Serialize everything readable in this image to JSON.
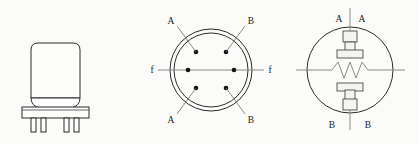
{
  "figure": {
    "background_color": "#fbfbf9",
    "line_color": "#2b2b2b",
    "label_color": "#1a1a1a"
  },
  "panels": {
    "tube_outline": {
      "name": "tube-outline-view",
      "description": "Perspective outline of the glass envelope tube mounted on a rectangular base with four connecting pins",
      "pin_count": 4
    },
    "base_pinout": {
      "name": "base-pinout-view",
      "description": "Bottom view of the tube base showing six contact pins inside two concentric circles",
      "pin_count": 6,
      "pin_labels": {
        "top_left": "A",
        "top_right": "B",
        "left": "f",
        "right": "f",
        "bottom_left": "A",
        "bottom_right": "B"
      },
      "leader_labels": [
        {
          "id": "a-top",
          "text": "A"
        },
        {
          "id": "b-top",
          "text": "B"
        },
        {
          "id": "f-left",
          "text": "f"
        },
        {
          "id": "f-right",
          "text": "f"
        },
        {
          "id": "a-bottom",
          "text": "A"
        },
        {
          "id": "b-bottom",
          "text": "B"
        }
      ]
    },
    "schematic": {
      "name": "internal-schematic-view",
      "description": "Circular envelope schematic with upper electrode A-A, lower electrode B-B and a zigzag resistive filament element across the centre",
      "top_terminals": [
        {
          "id": "a-left",
          "text": "A"
        },
        {
          "id": "a-right",
          "text": "A"
        }
      ],
      "bottom_terminals": [
        {
          "id": "b-left",
          "text": "B"
        },
        {
          "id": "b-right",
          "text": "B"
        }
      ],
      "element_type": "zigzag-resistor",
      "zigzag_peaks": 3
    }
  }
}
